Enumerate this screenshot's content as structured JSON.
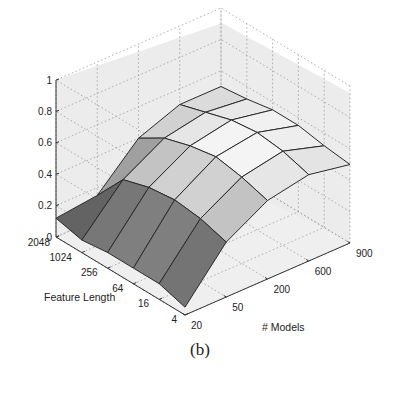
{
  "caption": "(b)",
  "chart_data": {
    "type": "surface3d",
    "title": "",
    "zlabel": "",
    "xlabel": "# Models",
    "ylabel": "Feature Length",
    "zlim": [
      0,
      1
    ],
    "z_ticks": [
      "0",
      "0.2",
      "0.4",
      "0.6",
      "0.8",
      "1"
    ],
    "x_ticks": [
      "20",
      "50",
      "200",
      "600",
      "900"
    ],
    "y_ticks": [
      "4",
      "16",
      "64",
      "256",
      "1024",
      "2048"
    ],
    "grid": true,
    "x": [
      20,
      50,
      200,
      600,
      900
    ],
    "y": [
      4,
      16,
      64,
      256,
      1024,
      2048
    ],
    "z": [
      [
        0.05,
        0.35,
        0.5,
        0.55,
        0.5
      ],
      [
        0.1,
        0.4,
        0.55,
        0.6,
        0.52
      ],
      [
        0.1,
        0.42,
        0.58,
        0.62,
        0.55
      ],
      [
        0.1,
        0.4,
        0.55,
        0.6,
        0.55
      ],
      [
        0.08,
        0.35,
        0.5,
        0.55,
        0.52
      ],
      [
        0.12,
        0.15,
        0.4,
        0.5,
        0.5
      ]
    ]
  }
}
